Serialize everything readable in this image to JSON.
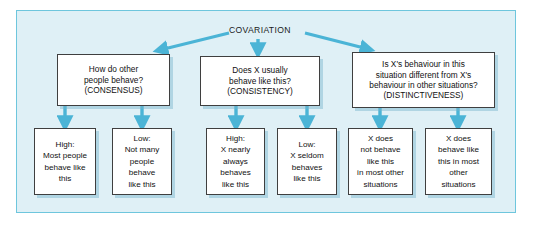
{
  "figure": {
    "title": "COVARIATION",
    "panel_bg": "#dff0f6",
    "panel_border": "#6ec6dd",
    "arrow_color": "#4bb4d6",
    "box_bg": "#ffffff",
    "box_border": "#3f3f3f"
  },
  "chart_data": {
    "type": "diagram",
    "title": "COVARIATION",
    "root": "COVARIATION",
    "branches": [
      {
        "id": "consensus",
        "lines": [
          "How do other",
          "people behave?",
          "(CONSENSUS)"
        ],
        "children": [
          {
            "id": "consensus-high",
            "lines": [
              "High:",
              "Most people",
              "behave like",
              "this"
            ]
          },
          {
            "id": "consensus-low",
            "lines": [
              "Low:",
              "Not many",
              "people",
              "behave",
              "like this"
            ]
          }
        ]
      },
      {
        "id": "consistency",
        "lines": [
          "Does X usually",
          "behave like this?",
          "(CONSISTENCY)"
        ],
        "children": [
          {
            "id": "consistency-high",
            "lines": [
              "High:",
              "X nearly",
              "always",
              "behaves",
              "like this"
            ]
          },
          {
            "id": "consistency-low",
            "lines": [
              "Low:",
              "X seldom",
              "behaves",
              "like this"
            ]
          }
        ]
      },
      {
        "id": "distinctiveness",
        "lines": [
          "Is X's behaviour in this",
          "situation different from X's",
          "behaviour in other situations?",
          "(DISTINCTIVENESS)"
        ],
        "children": [
          {
            "id": "distinctiveness-high",
            "lines": [
              "X does",
              "not behave",
              "like this",
              "in most other",
              "situations"
            ]
          },
          {
            "id": "distinctiveness-low",
            "lines": [
              "X does",
              "behave like",
              "this in most",
              "other",
              "situations"
            ]
          }
        ]
      }
    ]
  }
}
